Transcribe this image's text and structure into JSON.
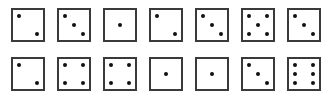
{
  "dice_rows": [
    {
      "name": "top-row",
      "faces": [
        2,
        3,
        1,
        2,
        3,
        5,
        3
      ]
    },
    {
      "name": "bottom-row",
      "faces": [
        2,
        4,
        4,
        1,
        1,
        3,
        6
      ]
    }
  ],
  "colors": {
    "border": "#3a3a3a",
    "pip": "#111111",
    "face": "#ffffff"
  }
}
